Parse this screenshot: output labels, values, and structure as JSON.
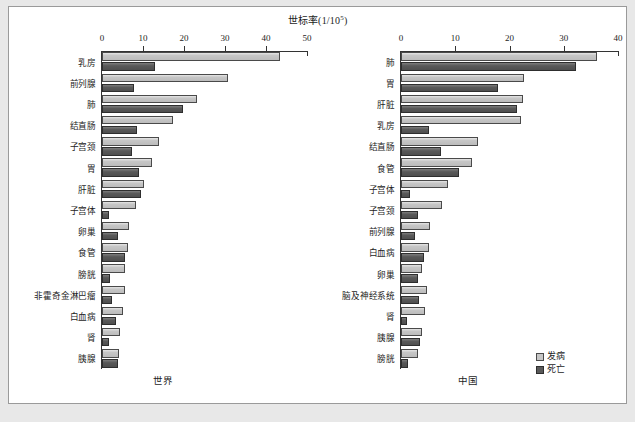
{
  "figure": {
    "title_text": "世标率(1/10",
    "title_sup": "5",
    "title_tail": ")",
    "title_full": "世标率(1/10⁵)",
    "legend": {
      "incidence_label": "发病",
      "mortality_label": "死亡",
      "incidence_color": "#c6c6c6",
      "mortality_color": "#595959"
    }
  },
  "chart_data": [
    {
      "type": "bar",
      "orientation": "horizontal",
      "title": "世界",
      "panel_caption": "世界",
      "xlabel": "世标率(1/10⁵)",
      "ylabel": "",
      "xlim": [
        0,
        50
      ],
      "xticks": [
        0,
        10,
        20,
        30,
        40,
        50
      ],
      "xtick_labels": [
        "0",
        "10",
        "20",
        "30",
        "40",
        "50"
      ],
      "grid": false,
      "legend_position": "outside-bottom-right",
      "categories": [
        "乳房",
        "前列腺",
        "肺",
        "结直肠",
        "子宫颈",
        "胃",
        "肝脏",
        "子宫体",
        "卵巢",
        "食管",
        "膀胱",
        "非霍奇金淋巴瘤",
        "白血病",
        "肾",
        "胰腺"
      ],
      "series": [
        {
          "name": "发病",
          "color": "#c6c6c6",
          "values": [
            43.3,
            30.7,
            23.1,
            17.2,
            13.9,
            12.1,
            10.3,
            8.4,
            6.6,
            6.3,
            5.7,
            5.6,
            5.0,
            4.4,
            4.1
          ]
        },
        {
          "name": "死亡",
          "color": "#595959",
          "values": [
            13.0,
            7.8,
            19.7,
            8.5,
            7.3,
            9.0,
            9.5,
            1.7,
            3.9,
            5.5,
            2.0,
            2.5,
            3.5,
            1.8,
            4.0
          ]
        }
      ]
    },
    {
      "type": "bar",
      "orientation": "horizontal",
      "title": "中国",
      "panel_caption": "中国",
      "xlabel": "世标率(1/10⁵)",
      "ylabel": "",
      "xlim": [
        0,
        40
      ],
      "xticks": [
        0,
        10,
        20,
        30,
        40
      ],
      "xtick_labels": [
        "0",
        "10",
        "20",
        "30",
        "40"
      ],
      "grid": false,
      "legend_position": "outside-bottom-right",
      "categories": [
        "肺",
        "胃",
        "肝脏",
        "乳房",
        "结直肠",
        "食管",
        "子宫体",
        "子宫颈",
        "前列腺",
        "白血病",
        "卵巢",
        "脑及神经系统",
        "肾",
        "胰腺",
        "膀胱"
      ],
      "series": [
        {
          "name": "发病",
          "color": "#c6c6c6",
          "values": [
            36.1,
            22.7,
            22.4,
            22.1,
            14.2,
            13.0,
            8.6,
            7.5,
            5.3,
            5.1,
            3.9,
            4.8,
            4.4,
            3.8,
            3.1
          ]
        },
        {
          "name": "死亡",
          "color": "#595959",
          "values": [
            32.2,
            17.9,
            21.3,
            5.2,
            7.4,
            10.7,
            1.6,
            3.2,
            2.5,
            4.3,
            3.2,
            3.3,
            1.1,
            3.5,
            1.3
          ]
        }
      ]
    }
  ]
}
